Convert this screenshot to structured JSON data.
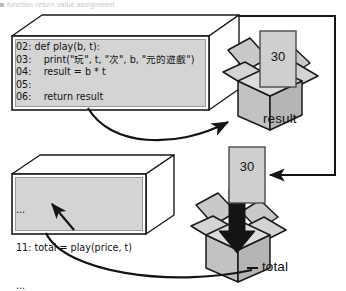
{
  "header": {
    "cut_off_text": "function return value assignment"
  },
  "diagram": {
    "function_block": {
      "name": "function-definition-block",
      "lines": [
        "02: def play(b, t):",
        "03:    print(\"玩\", t, \"次\", b, \"元的遊戲\")",
        "04:    result = b * t",
        "05:",
        "06:    return result"
      ],
      "text": "02: def play(b, t):\n03:    print(\"玩\", t, \"次\", b, \"元的遊戲\")\n04:    result = b * t\n05:\n06:    return result"
    },
    "caller_block": {
      "name": "caller-code-block",
      "lines": [
        "...",
        "11: total = play(price, t)",
        "..."
      ],
      "dots_top": "...",
      "call_line": "11: total = play(price, t)",
      "dots_bottom": "..."
    },
    "values": {
      "result_value": "30",
      "total_value": "30"
    },
    "labels": {
      "result": "result",
      "total": "total"
    },
    "colors": {
      "code_fill": "#d4d4d4",
      "slab_face": "#ffffff",
      "box_fill": "#c9c9c9",
      "card_fill": "#cfcfcf",
      "stroke": "#1a1a1a",
      "text": "#111111"
    }
  }
}
